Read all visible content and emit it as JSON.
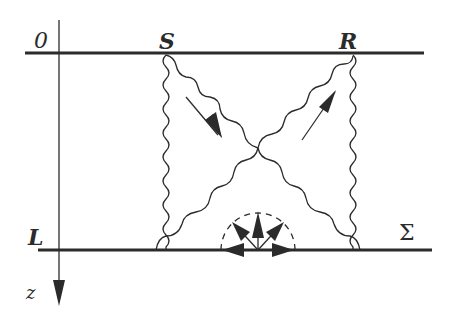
{
  "diagram": {
    "type": "wave-scattering-schematic",
    "labels": {
      "origin": "0",
      "source": "S",
      "receiver": "R",
      "depth": "L",
      "surface": "Σ",
      "axis": "z"
    },
    "colors": {
      "ink": "#2b2b2b",
      "background": "#ffffff"
    },
    "elements": {
      "top_boundary": {
        "from": [
          25,
          53
        ],
        "to": [
          424,
          53
        ]
      },
      "bottom_boundary": {
        "from": [
          38,
          250
        ],
        "to": [
          432,
          250
        ]
      },
      "z_axis": {
        "x": 59,
        "from_y": 20,
        "to_y": 305
      },
      "source_point": [
        166,
        54
      ],
      "receiver_point": [
        353,
        54
      ],
      "crossing_point": [
        258,
        148
      ],
      "scatter_center": [
        258,
        250
      ],
      "scatter_radius": 37
    }
  }
}
